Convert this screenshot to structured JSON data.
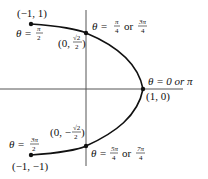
{
  "figure": {
    "axes": {
      "x_axis": {
        "y_px": 89,
        "x_from": 0,
        "x_to": 183
      },
      "y_axis": {
        "x_px": 86,
        "y_from": 10,
        "y_to": 166
      }
    },
    "points": [
      {
        "id": "p1",
        "coord": "(−1, 1)",
        "theta": "θ = π/2"
      },
      {
        "id": "p2",
        "coord": "(0, √2/2)",
        "theta": "θ = π/4 or 3π/4"
      },
      {
        "id": "p3",
        "coord": "(1, 0)",
        "theta": "θ = 0 or π"
      },
      {
        "id": "p4",
        "coord": "(0, −√2/2)",
        "theta": "θ = 5π/4 or 7π/4"
      },
      {
        "id": "p5",
        "coord": "(−1, −1)",
        "theta": "θ = 3π/2"
      }
    ],
    "labels": {
      "p1_coord": "(−1, 1)",
      "p1_theta": "θ =",
      "p1_num": "π",
      "p1_den": "2",
      "p2_coord_pre": "(0,",
      "p2_num": "√2",
      "p2_den": "2",
      "p2_coord_post": ")",
      "p2_theta_pre": "θ =",
      "p2_a_num": "π",
      "p2_a_den": "4",
      "p2_or": "or",
      "p2_b_num": "3π",
      "p2_b_den": "4",
      "p3_theta": "θ = 0 or π",
      "p3_coord": "(1, 0)",
      "p4_coord_pre": "(0, −",
      "p4_num": "√2",
      "p4_den": "2",
      "p4_coord_post": ")",
      "p4_theta_pre": "θ =",
      "p4_a_num": "5π",
      "p4_a_den": "4",
      "p4_or": "or",
      "p4_b_num": "7π",
      "p4_b_den": "4",
      "p5_theta": "θ =",
      "p5_num": "3π",
      "p5_den": "2",
      "p5_coord": "(−1, −1)"
    }
  }
}
